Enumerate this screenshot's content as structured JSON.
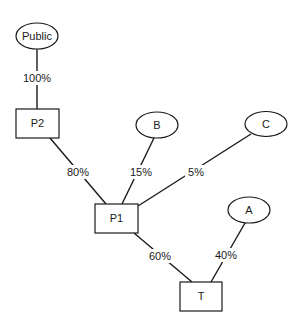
{
  "diagram": {
    "type": "ownership-structure",
    "nodes": [
      {
        "id": "public",
        "label": "Public",
        "shape": "ellipse"
      },
      {
        "id": "p2",
        "label": "P2",
        "shape": "rect"
      },
      {
        "id": "b",
        "label": "B",
        "shape": "ellipse"
      },
      {
        "id": "c",
        "label": "C",
        "shape": "ellipse"
      },
      {
        "id": "p1",
        "label": "P1",
        "shape": "rect"
      },
      {
        "id": "a",
        "label": "A",
        "shape": "ellipse"
      },
      {
        "id": "t",
        "label": "T",
        "shape": "rect"
      }
    ],
    "edges": [
      {
        "from": "public",
        "to": "p2",
        "label": "100%"
      },
      {
        "from": "p2",
        "to": "p1",
        "label": "80%"
      },
      {
        "from": "b",
        "to": "p1",
        "label": "15%"
      },
      {
        "from": "c",
        "to": "p1",
        "label": "5%"
      },
      {
        "from": "p1",
        "to": "t",
        "label": "60%"
      },
      {
        "from": "a",
        "to": "t",
        "label": "40%"
      }
    ]
  }
}
